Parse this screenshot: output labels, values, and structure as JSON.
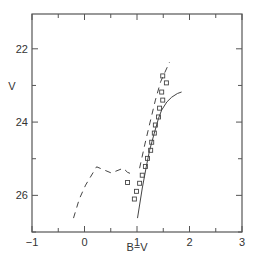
{
  "chart_data": {
    "type": "scatter",
    "title": "",
    "xlabel": "B−V",
    "ylabel": "V",
    "xlim": [
      -1,
      3
    ],
    "ylim": [
      27.0,
      21.05
    ],
    "y_inverted": true,
    "grid": false,
    "legend": null,
    "x_ticks": [
      {
        "value": -1,
        "label": "−1"
      },
      {
        "value": 0,
        "label": "0"
      },
      {
        "value": 1,
        "label": "1"
      },
      {
        "value": 2,
        "label": "2"
      },
      {
        "value": 3,
        "label": "3"
      }
    ],
    "y_ticks": [
      {
        "value": 22,
        "label": "22"
      },
      {
        "value": 24,
        "label": "24"
      },
      {
        "value": 26,
        "label": "26"
      }
    ],
    "series": [
      {
        "name": "observed",
        "kind": "scatter",
        "marker": "open-square",
        "points": [
          [
            1.49,
            22.74
          ],
          [
            1.56,
            22.93
          ],
          [
            1.47,
            23.18
          ],
          [
            1.49,
            23.4
          ],
          [
            1.43,
            23.62
          ],
          [
            1.41,
            23.86
          ],
          [
            1.35,
            24.08
          ],
          [
            1.33,
            24.3
          ],
          [
            1.28,
            24.55
          ],
          [
            1.26,
            24.77
          ],
          [
            1.2,
            24.99
          ],
          [
            1.16,
            25.21
          ],
          [
            1.1,
            25.45
          ],
          [
            1.05,
            25.67
          ],
          [
            0.99,
            25.89
          ],
          [
            0.95,
            26.1
          ],
          [
            0.82,
            25.65
          ]
        ]
      },
      {
        "name": "model-solid",
        "kind": "line",
        "style": "solid",
        "points": [
          [
            1.01,
            26.62
          ],
          [
            1.1,
            25.8
          ],
          [
            1.18,
            25.2
          ],
          [
            1.24,
            24.77
          ],
          [
            1.33,
            24.3
          ],
          [
            1.41,
            23.9
          ],
          [
            1.47,
            23.67
          ],
          [
            1.57,
            23.45
          ],
          [
            1.66,
            23.32
          ],
          [
            1.77,
            23.22
          ],
          [
            1.85,
            23.18
          ]
        ]
      },
      {
        "name": "model-dashed",
        "kind": "line",
        "style": "dashed",
        "points": [
          [
            1.05,
            25.26
          ],
          [
            1.15,
            24.6
          ],
          [
            1.25,
            24.0
          ],
          [
            1.35,
            23.4
          ],
          [
            1.45,
            22.9
          ],
          [
            1.62,
            22.36
          ]
        ]
      },
      {
        "name": "model-dashed-lower",
        "kind": "line",
        "style": "dashed",
        "points": [
          [
            -0.21,
            26.62
          ],
          [
            -0.1,
            26.1
          ],
          [
            0.02,
            25.72
          ],
          [
            0.23,
            25.22
          ],
          [
            0.51,
            25.39
          ],
          [
            0.74,
            25.26
          ],
          [
            0.82,
            25.37
          ],
          [
            0.95,
            25.45
          ]
        ]
      }
    ]
  }
}
